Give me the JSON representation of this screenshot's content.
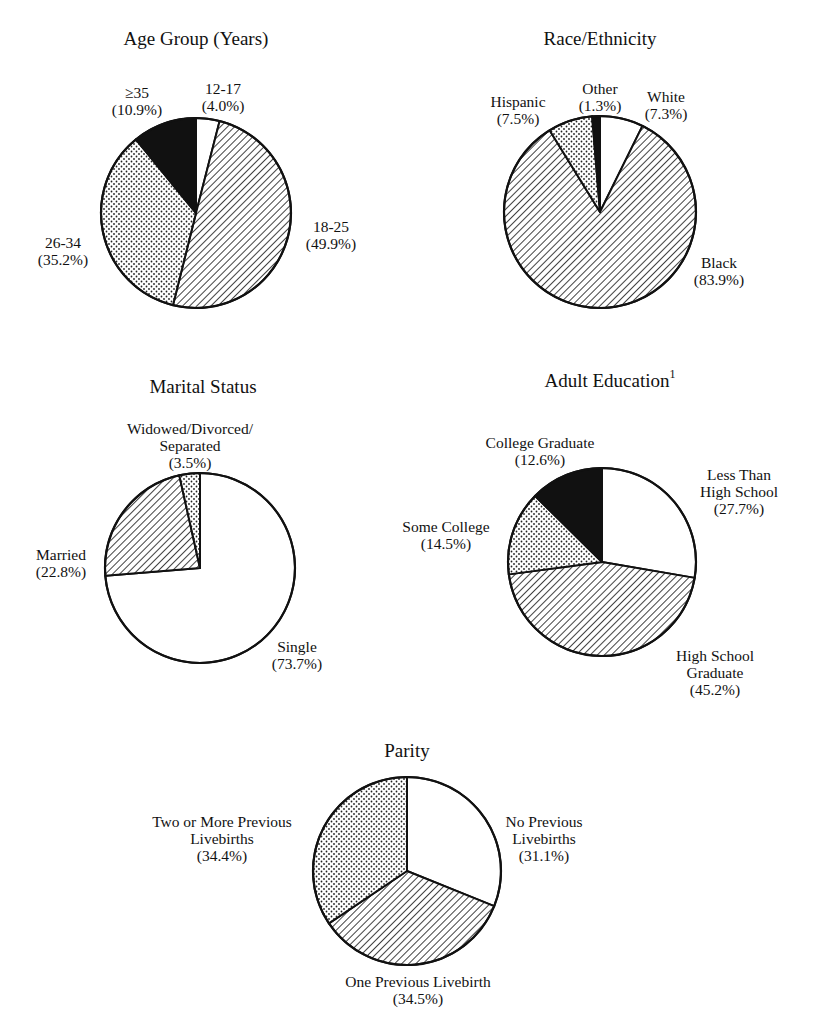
{
  "chart_data": [
    {
      "type": "pie",
      "title": "Age Group (Years)",
      "categories": [
        "12-17",
        "18-25",
        "26-34",
        "≥35"
      ],
      "values": [
        4.0,
        49.9,
        35.2,
        10.9
      ],
      "labels": [
        "(4.0%)",
        "(49.9%)",
        "(35.2%)",
        "(10.9%)"
      ],
      "fills": [
        "white",
        "hatch",
        "dots",
        "black"
      ],
      "center": [
        196,
        213
      ],
      "radius": 95
    },
    {
      "type": "pie",
      "title": "Race/Ethnicity",
      "categories": [
        "White",
        "Black",
        "Hispanic",
        "Other"
      ],
      "values": [
        7.3,
        83.9,
        7.5,
        1.3
      ],
      "labels": [
        "(7.3%)",
        "(83.9%)",
        "(7.5%)",
        "(1.3%)"
      ],
      "fills": [
        "white",
        "hatch",
        "dots",
        "black"
      ],
      "center": [
        600,
        212
      ],
      "radius": 96
    },
    {
      "type": "pie",
      "title": "Marital Status",
      "categories": [
        "Single",
        "Married",
        "Widowed/Divorced/Separated"
      ],
      "values": [
        73.7,
        22.8,
        3.5
      ],
      "labels": [
        "(73.7%)",
        "(22.8%)",
        "(3.5%)"
      ],
      "fills": [
        "white",
        "hatch",
        "dots"
      ],
      "center": [
        200,
        568
      ],
      "radius": 95
    },
    {
      "type": "pie",
      "title": "Adult Education",
      "title_superscript": "1",
      "categories": [
        "Less Than High School",
        "High School Graduate",
        "Some College",
        "College Graduate"
      ],
      "values": [
        27.7,
        45.2,
        14.5,
        12.6
      ],
      "labels": [
        "(27.7%)",
        "(45.2%)",
        "(14.5%)",
        "(12.6%)"
      ],
      "fills": [
        "white",
        "hatch",
        "dots",
        "black"
      ],
      "center": [
        602,
        562
      ],
      "radius": 94
    },
    {
      "type": "pie",
      "title": "Parity",
      "categories": [
        "No Previous Livebirths",
        "One Previous Livebirth",
        "Two or More Previous Livebirths"
      ],
      "values": [
        31.1,
        34.5,
        34.4
      ],
      "labels": [
        "(31.1%)",
        "(34.5%)",
        "(34.4%)"
      ],
      "fills": [
        "white",
        "hatch",
        "dots"
      ],
      "center": [
        407,
        871
      ],
      "radius": 94
    }
  ],
  "text": {
    "age": {
      "title": "Age Group (Years)",
      "l1217_a": "12-17",
      "l1217_b": "(4.0%)",
      "l1825_a": "18-25",
      "l1825_b": "(49.9%)",
      "l2634_a": "26-34",
      "l2634_b": "(35.2%)",
      "l35_a": "≥35",
      "l35_b": "(10.9%)"
    },
    "race": {
      "title": "Race/Ethnicity",
      "white_a": "White",
      "white_b": "(7.3%)",
      "black_a": "Black",
      "black_b": "(83.9%)",
      "hisp_a": "Hispanic",
      "hisp_b": "(7.5%)",
      "other_a": "Other",
      "other_b": "(1.3%)"
    },
    "marital": {
      "title": "Marital Status",
      "wds_a": "Widowed/Divorced/",
      "wds_b": "Separated",
      "wds_c": "(3.5%)",
      "married_a": "Married",
      "married_b": "(22.8%)",
      "single_a": "Single",
      "single_b": "(73.7%)"
    },
    "edu": {
      "title": "Adult Education",
      "title_sup": "1",
      "cg_a": "College Graduate",
      "cg_b": "(12.6%)",
      "lths_a": "Less Than",
      "lths_b": "High School",
      "lths_c": "(27.7%)",
      "sc_a": "Some College",
      "sc_b": "(14.5%)",
      "hsg_a": "High School",
      "hsg_b": "Graduate",
      "hsg_c": "(45.2%)"
    },
    "parity": {
      "title": "Parity",
      "two_a": "Two or More Previous",
      "two_b": "Livebirths",
      "two_c": "(34.4%)",
      "none_a": "No Previous",
      "none_b": "Livebirths",
      "none_c": "(31.1%)",
      "one_a": "One Previous Livebirth",
      "one_b": "(34.5%)"
    }
  }
}
